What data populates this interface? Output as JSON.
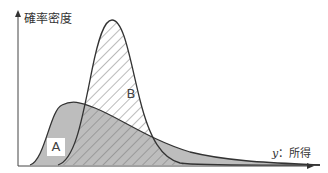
{
  "diagram": {
    "y_axis_label": "確率密度",
    "x_axis_label_var": "y",
    "x_axis_label_text": "：所得",
    "regions": [
      {
        "id": "A",
        "label": "A",
        "fill": "#bdbdbd",
        "pattern": "solid gray",
        "description": "wide right-skewed distribution"
      },
      {
        "id": "B",
        "label": "B",
        "fill": "hatched",
        "pattern": "diagonal hatch",
        "description": "narrow peaked distribution"
      }
    ],
    "colors": {
      "line": "#333333",
      "fill_A": "#bdbdbd",
      "hatch": "#888888",
      "axis": "#444444"
    }
  }
}
